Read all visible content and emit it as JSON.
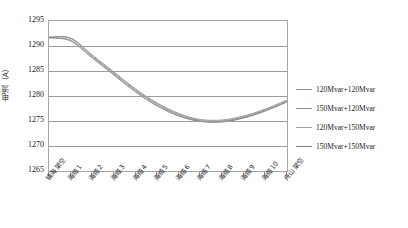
{
  "chart_data": {
    "type": "line",
    "title": "",
    "xlabel": "",
    "ylabel": "电流（A）",
    "ylim": [
      1265,
      1295
    ],
    "yticks": [
      1295,
      1290,
      1285,
      1280,
      1275,
      1270,
      1265
    ],
    "grid": true,
    "legend_position": "right",
    "categories": [
      "镇海架空",
      "海缆1",
      "海缆2",
      "海缆3",
      "海缆4",
      "海缆5",
      "海缆6",
      "海缆7",
      "海缆8",
      "海缆9",
      "海缆10",
      "舟山架空"
    ],
    "series": [
      {
        "name": "120Mvar+120Mvar",
        "color": "#8c8c8c",
        "values": [
          1291.7,
          1291.5,
          1288.0,
          1284.6,
          1281.2,
          1278.4,
          1276.3,
          1275.1,
          1275.0,
          1275.8,
          1277.2,
          1279.0
        ]
      },
      {
        "name": "150Mvar+120Mvar",
        "color": "#8c8c8c",
        "values": [
          1291.8,
          1291.6,
          1288.2,
          1284.8,
          1281.4,
          1278.6,
          1276.5,
          1275.3,
          1275.2,
          1276.0,
          1277.4,
          1279.2
        ]
      },
      {
        "name": "120Mvar+150Mvar",
        "color": "#9e9e9e",
        "values": [
          1291.6,
          1291.2,
          1287.8,
          1284.4,
          1281.0,
          1278.2,
          1276.1,
          1275.0,
          1274.9,
          1275.7,
          1277.1,
          1278.9
        ]
      },
      {
        "name": "150Mvar+150Mvar",
        "color": "#7d7d7d",
        "values": [
          1291.7,
          1291.0,
          1287.6,
          1284.2,
          1280.8,
          1278.0,
          1276.0,
          1274.9,
          1274.8,
          1275.6,
          1277.0,
          1278.8
        ]
      }
    ]
  },
  "caption": {
    "text": ""
  }
}
